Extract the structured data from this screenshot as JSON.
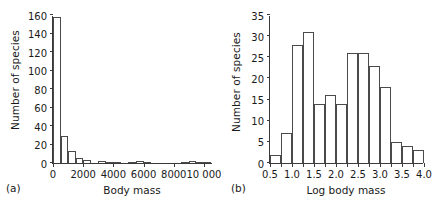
{
  "figure": {
    "background": "#ffffff",
    "axis_color": "#3a3a3a",
    "bar_edge_color": "#4a4a4a",
    "bar_fill_color": "#ffffff"
  },
  "panels": [
    {
      "tag": "(a)",
      "ylabel": "Number of species",
      "xlabel": "Body mass"
    },
    {
      "tag": "(b)",
      "ylabel": "Number of species",
      "xlabel": "Log body mass"
    }
  ],
  "chart_data": [
    {
      "type": "bar",
      "title": "",
      "panel": "(a)",
      "xlabel": "Body mass",
      "ylabel": "Number of species",
      "xlim": [
        0,
        10600
      ],
      "ylim": [
        0,
        160
      ],
      "xticks": [
        0,
        2000,
        4000,
        6000,
        8000,
        10000
      ],
      "xtick_labels": [
        "0",
        "2000",
        "4000",
        "6000",
        "8000",
        "10 000"
      ],
      "yticks": [
        0,
        20,
        40,
        60,
        80,
        100,
        120,
        140,
        160
      ],
      "ytick_labels": [
        "0",
        "20",
        "40",
        "60",
        "80",
        "100",
        "120",
        "140",
        "160"
      ],
      "grid": false,
      "legend": "none",
      "bin_width": 500,
      "bin_starts": [
        0,
        500,
        1000,
        1500,
        2000,
        2500,
        3000,
        3500,
        4000,
        4500,
        5000,
        5500,
        6000,
        6500,
        7000,
        7500,
        8000,
        8500,
        9000,
        9500,
        10000
      ],
      "values": [
        158,
        29,
        13,
        5,
        3,
        0,
        2,
        1,
        1,
        0,
        1,
        2,
        1,
        0,
        0,
        0,
        0,
        1,
        2,
        1,
        1
      ]
    },
    {
      "type": "bar",
      "title": "",
      "panel": "(b)",
      "xlabel": "Log body mass",
      "ylabel": "Number of species",
      "xlim": [
        0.5,
        4.0
      ],
      "ylim": [
        0,
        35
      ],
      "xticks": [
        0.5,
        1.0,
        1.5,
        2.0,
        2.5,
        3.0,
        3.5,
        4.0
      ],
      "xtick_labels": [
        "0.5",
        "1.0",
        "1.5",
        "2.0",
        "2.5",
        "3.0",
        "3.5",
        "4.0"
      ],
      "yticks": [
        0,
        5,
        10,
        15,
        20,
        25,
        30,
        35
      ],
      "ytick_labels": [
        "0",
        "5",
        "10",
        "15",
        "20",
        "25",
        "30",
        "35"
      ],
      "grid": false,
      "legend": "none",
      "bin_width": 0.25,
      "bin_starts": [
        0.5,
        0.75,
        1.0,
        1.25,
        1.5,
        1.75,
        2.0,
        2.25,
        2.5,
        2.75,
        3.0,
        3.25,
        3.5,
        3.75
      ],
      "values": [
        2,
        7,
        28,
        31,
        14,
        16,
        14,
        26,
        26,
        23,
        18,
        5,
        4,
        3
      ]
    }
  ]
}
